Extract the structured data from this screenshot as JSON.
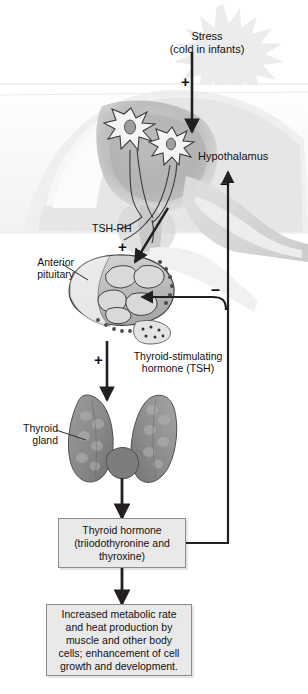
{
  "diagram": {
    "type": "physiology-flow-diagram",
    "background_color": "#ffffff",
    "box_fill": "#e9e9e9",
    "box_border": "#8d8d8d",
    "line_color": "#231f20",
    "starburst_color": "#ececec"
  },
  "stimulus": {
    "label": "Stress\n(cold in infants)",
    "shape": "starburst"
  },
  "labels": {
    "hypothalamus": "Hypothalamus",
    "anterior_pituitary": "Anterior\npituitary",
    "thyroid_gland": "Thyroid\ngland",
    "tsh_rh": "TSH-RH",
    "tsh": "Thyroid-stimulating\nhormone (TSH)"
  },
  "boxes": {
    "thyroid_hormone": "Thyroid hormone\n(triiodothyronine and\nthyroxine)",
    "effects": "Increased metabolic rate\nand heat production by\nmuscle and other body\ncells; enhancement of cell\ngrowth and development."
  },
  "signs": {
    "stress_to_hypothalamus": "+",
    "tsh_rh_positive": "+",
    "tsh_positive": "+",
    "feedback_hypothalamus": "–",
    "feedback_pituitary": "–"
  },
  "arrows": [
    {
      "name": "stress-to-hypothalamus",
      "from": "Stress",
      "to": "Hypothalamus",
      "sign": "+"
    },
    {
      "name": "tsh-rh-to-pituitary",
      "from": "Hypothalamus",
      "to": "Anterior pituitary",
      "sign": "+"
    },
    {
      "name": "tsh-to-thyroid",
      "from": "Anterior pituitary",
      "to": "Thyroid gland",
      "sign": "+"
    },
    {
      "name": "thyroid-to-hormone",
      "from": "Thyroid gland",
      "to": "Thyroid hormone",
      "sign": ""
    },
    {
      "name": "hormone-to-effects",
      "from": "Thyroid hormone",
      "to": "Increased metabolic rate",
      "sign": ""
    },
    {
      "name": "feedback-to-hypothalamus",
      "from": "Thyroid hormone",
      "to": "Hypothalamus",
      "sign": "–"
    },
    {
      "name": "feedback-to-pituitary",
      "from": "Thyroid hormone",
      "to": "Anterior pituitary",
      "sign": "–"
    }
  ]
}
